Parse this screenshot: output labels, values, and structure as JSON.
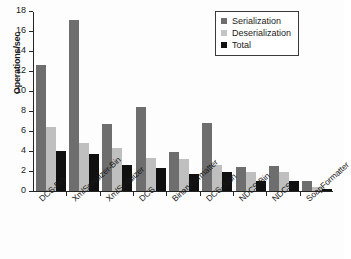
{
  "chart_data": {
    "type": "bar",
    "title": "",
    "xlabel": "",
    "ylabel": "Operations/sec",
    "ylim": [
      0,
      18
    ],
    "yticks": [
      0,
      2,
      4,
      6,
      8,
      10,
      12,
      14,
      16,
      18
    ],
    "ytick_labels": [
      "0",
      "2",
      "4",
      "6",
      "8",
      "10",
      "12",
      "14",
      "16",
      "18"
    ],
    "grid": false,
    "legend_position": "top-right",
    "categories": [
      "DCS-Bin",
      "XmlSerializer-Bin",
      "XmlSerializer",
      "DCS",
      "BinaryFormatter",
      "DCS-Json",
      "NDCS-Bin",
      "NDCS",
      "SoapFormatter"
    ],
    "series": [
      {
        "name": "Serialization",
        "color": "#6e6e6e",
        "values": [
          12.6,
          17.15,
          6.75,
          8.4,
          3.95,
          6.85,
          2.45,
          2.55,
          1.05
        ]
      },
      {
        "name": "Deserialization",
        "color": "#bfbfbf",
        "values": [
          6.4,
          4.8,
          4.3,
          3.3,
          3.25,
          2.65,
          1.9,
          1.9,
          0.45
        ]
      },
      {
        "name": "Total",
        "color": "#101010",
        "values": [
          4.05,
          3.75,
          2.6,
          2.35,
          1.75,
          1.9,
          1.05,
          1.05,
          0.25
        ]
      }
    ]
  }
}
